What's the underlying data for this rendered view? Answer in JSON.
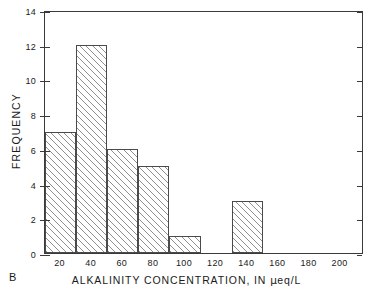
{
  "panel": {
    "label": "B"
  },
  "chart_data": {
    "type": "bar",
    "title": "",
    "subtitle": "",
    "xlabel_parts": {
      "before_mu": "ALKALINITY CONCENTRATION, IN ",
      "mu": "μ",
      "after_mu": "eq/L"
    },
    "xlabel": "ALKALINITY CONCENTRATION, IN μeq/L",
    "ylabel": "FREQUENCY",
    "xlim": [
      10,
      215
    ],
    "ylim": [
      0,
      14
    ],
    "xticks": [
      20,
      40,
      60,
      80,
      100,
      120,
      140,
      160,
      180,
      200
    ],
    "xtick_labels": [
      "20",
      "40",
      "60",
      "80",
      "100",
      "120",
      "140",
      "160",
      "180",
      "200"
    ],
    "yticks": [
      0,
      2,
      4,
      6,
      8,
      10,
      12,
      14
    ],
    "ytick_labels": [
      "0",
      "2",
      "4",
      "6",
      "8",
      "10",
      "12",
      "14"
    ],
    "grid": false,
    "legend": null,
    "bin_width": 20,
    "bin_edges": [
      10,
      30,
      50,
      70,
      90,
      110,
      130,
      150,
      170,
      190,
      210
    ],
    "categories": [
      "10-30",
      "30-50",
      "50-70",
      "70-90",
      "90-110",
      "110-130",
      "130-150",
      "150-170",
      "170-190",
      "190-210"
    ],
    "values": [
      7,
      12,
      6,
      5,
      1,
      0,
      3,
      0,
      0,
      0
    ],
    "bars": [
      {
        "bin_start": 10,
        "bin_end": 30,
        "value": 7
      },
      {
        "bin_start": 30,
        "bin_end": 50,
        "value": 12
      },
      {
        "bin_start": 50,
        "bin_end": 70,
        "value": 6
      },
      {
        "bin_start": 70,
        "bin_end": 90,
        "value": 5
      },
      {
        "bin_start": 90,
        "bin_end": 110,
        "value": 1
      },
      {
        "bin_start": 110,
        "bin_end": 130,
        "value": 0
      },
      {
        "bin_start": 130,
        "bin_end": 150,
        "value": 3
      },
      {
        "bin_start": 150,
        "bin_end": 170,
        "value": 0
      },
      {
        "bin_start": 170,
        "bin_end": 190,
        "value": 0
      },
      {
        "bin_start": 190,
        "bin_end": 210,
        "value": 0
      }
    ],
    "colors": {
      "bar_edge": "#4a4a4a",
      "bar_hatch": "#8f8f8f",
      "bar_fill": "#ffffff",
      "axis": "#3a3a3a",
      "text": "#1a1a1a",
      "background": "#ffffff"
    }
  }
}
